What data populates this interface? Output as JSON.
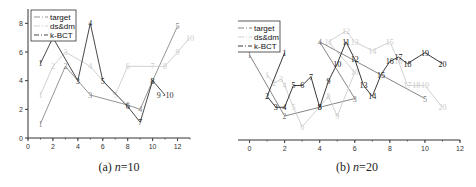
{
  "chart_data": [
    {
      "type": "line",
      "title": "",
      "caption_prefix": "(a) ",
      "caption_var": "n",
      "caption_suffix": "=10",
      "xlabel": "",
      "ylabel": "",
      "xlim": [
        0,
        13
      ],
      "ylim": [
        0,
        9
      ],
      "xticks": [
        0,
        2,
        4,
        6,
        8,
        10,
        12
      ],
      "yticks": [
        0,
        2,
        4,
        6,
        8
      ],
      "grid": false,
      "legend_position": "upper-left",
      "legend": [
        "target",
        "ds&dm",
        "k-BCT"
      ],
      "series": [
        {
          "name": "target",
          "color": "#888888",
          "points": [
            {
              "label": "1",
              "x": 1,
              "y": 1
            },
            {
              "label": "2",
              "x": 3,
              "y": 5
            },
            {
              "label": "3",
              "x": 5,
              "y": 3
            },
            {
              "label": "6",
              "x": 8,
              "y": 2.3
            },
            {
              "label": "4",
              "x": 9,
              "y": 2
            },
            {
              "label": "8",
              "x": 10,
              "y": 4
            },
            {
              "label": "5",
              "x": 12,
              "y": 7.8
            }
          ]
        },
        {
          "name": "ds&dm",
          "color": "#cccccc",
          "points": [
            {
              "label": "1",
              "x": 1,
              "y": 3
            },
            {
              "label": "2",
              "x": 2,
              "y": 5
            },
            {
              "label": "3",
              "x": 3,
              "y": 6
            },
            {
              "label": "4",
              "x": 5,
              "y": 5
            },
            {
              "label": "5",
              "x": 7,
              "y": 3
            },
            {
              "label": "6",
              "x": 8,
              "y": 5
            },
            {
              "label": "7",
              "x": 10,
              "y": 5
            },
            {
              "label": "8",
              "x": 11,
              "y": 5
            },
            {
              "label": "9",
              "x": 12,
              "y": 6
            },
            {
              "label": "10",
              "x": 13,
              "y": 7
            }
          ]
        },
        {
          "name": "k-BCT",
          "color": "#333333",
          "points": [
            {
              "label": "1",
              "x": 1,
              "y": 5.2
            },
            {
              "label": "2",
              "x": 2,
              "y": 7
            },
            {
              "label": "3",
              "x": 4,
              "y": 4
            },
            {
              "label": "4",
              "x": 5,
              "y": 8
            },
            {
              "label": "5",
              "x": 6,
              "y": 4
            },
            {
              "label": "6",
              "x": 8,
              "y": 2.2
            },
            {
              "label": "7",
              "x": 9,
              "y": 1.1
            },
            {
              "label": "8",
              "x": 10,
              "y": 4
            },
            {
              "label": "9 -10",
              "x": 11,
              "y": 3
            }
          ]
        }
      ]
    },
    {
      "type": "line",
      "title": "",
      "caption_prefix": "(b) ",
      "caption_var": "n",
      "caption_suffix": "=20",
      "xlabel": "",
      "ylabel": "",
      "xlim": [
        -1,
        12
      ],
      "ylim": [
        1.5,
        7
      ],
      "xticks": [
        0,
        2,
        4,
        6,
        8,
        10,
        12
      ],
      "yticks": [
        2,
        3,
        4,
        5,
        6,
        7
      ],
      "grid": false,
      "legend_position": "upper-left",
      "legend": [
        "target",
        "ds&dm",
        "k-BCT"
      ],
      "series": [
        {
          "name": "target",
          "color": "#777777",
          "points": [
            {
              "label": "1",
              "x": 0,
              "y": 5.4
            },
            {
              "label": "2",
              "x": 2,
              "y": 2.6
            },
            {
              "label": "8",
              "x": 4,
              "y": 3
            },
            {
              "label": "3",
              "x": 6,
              "y": 3.4
            },
            {
              "label": "4",
              "x": 4,
              "y": 6.0
            },
            {
              "label": "5",
              "x": 10,
              "y": 3.4
            }
          ]
        },
        {
          "name": "ds&dm",
          "color": "#cccccc",
          "points": [
            {
              "label": "1",
              "x": 1,
              "y": 4.5
            },
            {
              "label": "2",
              "x": 1.4,
              "y": 4.1
            },
            {
              "label": "3",
              "x": 1.8,
              "y": 4.3
            },
            {
              "label": "4",
              "x": 2,
              "y": 4.0
            },
            {
              "label": "5",
              "x": 2.5,
              "y": 3.0
            },
            {
              "label": "6",
              "x": 3,
              "y": 2.1
            },
            {
              "label": "8",
              "x": 4.5,
              "y": 3.5
            },
            {
              "label": "9",
              "x": 5,
              "y": 2.6
            },
            {
              "label": "10",
              "x": 6,
              "y": 4.6
            },
            {
              "label": "11",
              "x": 4.5,
              "y": 6.0
            },
            {
              "label": "12",
              "x": 5.5,
              "y": 6.5
            },
            {
              "label": "13",
              "x": 6,
              "y": 6.0
            },
            {
              "label": "14",
              "x": 7,
              "y": 5.6
            },
            {
              "label": "15",
              "x": 8,
              "y": 6.0
            },
            {
              "label": "16",
              "x": 8.5,
              "y": 5.1
            },
            {
              "label": "17",
              "x": 9,
              "y": 4.0
            },
            {
              "label": "18",
              "x": 9.5,
              "y": 4.0
            },
            {
              "label": "19",
              "x": 10,
              "y": 4.0
            },
            {
              "label": "20",
              "x": 11,
              "y": 3.0
            }
          ]
        },
        {
          "name": "k-BCT",
          "color": "#222222",
          "points": [
            {
              "label": "1",
              "x": 2,
              "y": 5.5
            },
            {
              "label": "2",
              "x": 1,
              "y": 3.5
            },
            {
              "label": "3",
              "x": 1.5,
              "y": 3.0
            },
            {
              "label": "4",
              "x": 2,
              "y": 3.0
            },
            {
              "label": "5",
              "x": 2.5,
              "y": 4.0
            },
            {
              "label": "6",
              "x": 3,
              "y": 4.0
            },
            {
              "label": "7",
              "x": 3.5,
              "y": 4.4
            },
            {
              "label": "8",
              "x": 4,
              "y": 3.0
            },
            {
              "label": "9",
              "x": 4.5,
              "y": 4.2
            },
            {
              "label": "10",
              "x": 5,
              "y": 5.0
            },
            {
              "label": "11",
              "x": 5.5,
              "y": 6.0
            },
            {
              "label": "12",
              "x": 6,
              "y": 5.2
            },
            {
              "label": "13",
              "x": 6.5,
              "y": 4.0
            },
            {
              "label": "14",
              "x": 7,
              "y": 3.5
            },
            {
              "label": "15",
              "x": 7.5,
              "y": 4.5
            },
            {
              "label": "16",
              "x": 8,
              "y": 5.1
            },
            {
              "label": "17",
              "x": 8.5,
              "y": 5.3
            },
            {
              "label": "18",
              "x": 9,
              "y": 5.0
            },
            {
              "label": "19",
              "x": 10,
              "y": 5.5
            },
            {
              "label": "20",
              "x": 11,
              "y": 5.0
            }
          ]
        }
      ]
    }
  ],
  "captions": {
    "a": {
      "prefix": "(a) ",
      "var": "n",
      "suffix": "=10"
    },
    "b": {
      "prefix": "(b) ",
      "var": "n",
      "suffix": "=20"
    }
  }
}
